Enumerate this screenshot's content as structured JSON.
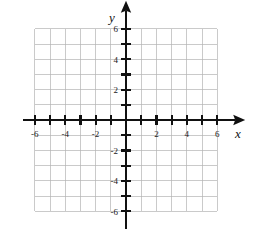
{
  "chart_data": {
    "type": "scatter",
    "title": "",
    "subtitle": "",
    "xlabel": "x",
    "ylabel": "y",
    "xlim": [
      -6,
      6
    ],
    "ylim": [
      -6,
      6
    ],
    "grid": true,
    "grid_step": 1,
    "tick_step": 1,
    "legend": null,
    "series": [],
    "x": [],
    "values": [],
    "annotations": [],
    "x_tick_labels": [
      "-6",
      "-4",
      "-2",
      "2",
      "4",
      "6"
    ],
    "x_tick_values": [
      -6,
      -4,
      -2,
      2,
      4,
      6
    ],
    "y_tick_labels": [
      "6",
      "4",
      "2",
      "-2",
      "-4",
      "-6"
    ],
    "y_tick_values": [
      6,
      4,
      2,
      -2,
      -4,
      -6
    ],
    "origin_label": ""
  },
  "figure": {
    "axis_x_label": "x",
    "axis_y_label": "y",
    "colors": {
      "background": "#ffffff",
      "gridline": "#b3b3b3",
      "axis": "#111111",
      "tick_text": "#1a1a1a"
    },
    "geometry": {
      "origin_px": [
        126,
        120
      ],
      "unit_px": 15.2,
      "grid_left_px": 35,
      "grid_right_px": 217,
      "grid_top_px": 29,
      "grid_bottom_px": 211
    }
  }
}
